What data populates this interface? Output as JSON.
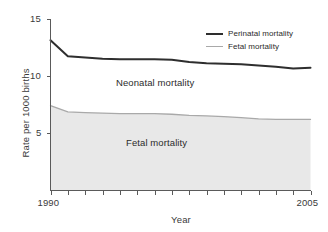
{
  "chart_data": {
    "type": "area",
    "title": "",
    "subtitle": "",
    "xlabel": "Year",
    "ylabel": "Rate per 1000 births",
    "xlim": [
      1990,
      2005
    ],
    "ylim": [
      0,
      15
    ],
    "grid": false,
    "legend_position": "top-right",
    "x_tick_labels": [
      "1990",
      "2005"
    ],
    "x_tick_values": [
      1990,
      2005
    ],
    "y_tick_labels": [
      "5",
      "10",
      "15"
    ],
    "y_tick_values": [
      5,
      10,
      15
    ],
    "x_minor_ticks": [
      1990,
      1991,
      1992,
      1993,
      1994,
      1995,
      1996,
      1997,
      1998,
      1999,
      2000,
      2001,
      2002,
      2003,
      2004,
      2005
    ],
    "x": [
      1990,
      1991,
      1992,
      1993,
      1994,
      1995,
      1996,
      1997,
      1998,
      1999,
      2000,
      2001,
      2002,
      2003,
      2004,
      2005
    ],
    "series": [
      {
        "name": "Perinatal mortality",
        "color": "#2e2e2e",
        "line_width": 2.0,
        "filled": false,
        "values": [
          13.1,
          11.7,
          11.6,
          11.5,
          11.45,
          11.45,
          11.45,
          11.4,
          11.2,
          11.1,
          11.05,
          11.0,
          10.9,
          10.8,
          10.65,
          10.7
        ]
      },
      {
        "name": "Fetal mortality",
        "color": "#a9a9a9",
        "line_width": 1.3,
        "filled": true,
        "fill_color": "#e8e8e8",
        "values": [
          7.4,
          6.85,
          6.8,
          6.75,
          6.7,
          6.7,
          6.7,
          6.65,
          6.55,
          6.5,
          6.45,
          6.35,
          6.25,
          6.2,
          6.2,
          6.2
        ]
      }
    ],
    "annotations": [
      {
        "text": "Neonatal mortality",
        "x": 1995.6,
        "y": 9.1
      },
      {
        "text": "Fetal mortality",
        "x": 1996.2,
        "y": 3.8
      }
    ]
  },
  "axes": {
    "y_ticks": [
      {
        "label": "15"
      },
      {
        "label": "10"
      },
      {
        "label": "5"
      }
    ],
    "x_ticks": [
      {
        "label": "1990"
      },
      {
        "label": "2005"
      }
    ],
    "y_axis_title": "Rate per 1000 births",
    "x_axis_title": "Year"
  },
  "legend": {
    "entries": [
      {
        "label": "Perinatal mortality"
      },
      {
        "label": "Fetal mortality"
      }
    ]
  },
  "annotations": {
    "neonatal": "Neonatal mortality",
    "fetal": "Fetal mortality"
  },
  "colors": {
    "perinatal_line": "#2e2e2e",
    "fetal_line": "#a9a9a9",
    "fetal_fill": "#e8e8e8",
    "axis": "#5a5a5a",
    "background": "#ffffff"
  }
}
